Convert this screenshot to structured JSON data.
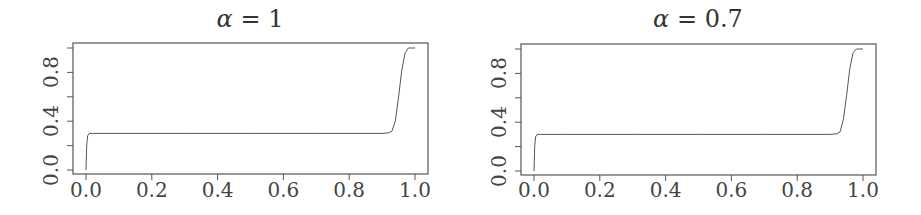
{
  "chart_data": [
    {
      "type": "line",
      "title": "α = 1",
      "title_symbol": "α",
      "title_rest": " = 1",
      "xlabel": "",
      "ylabel": "",
      "xlim": [
        0.0,
        1.0
      ],
      "ylim": [
        0.0,
        1.0
      ],
      "x_ticks": [
        "0.0",
        "0.2",
        "0.4",
        "0.6",
        "0.8",
        "1.0"
      ],
      "y_ticks_labeled": [
        "0.0",
        "0.4",
        "0.8"
      ],
      "y_ticks_all": [
        0.0,
        0.2,
        0.4,
        0.6,
        0.8,
        1.0
      ],
      "grid": false,
      "legend": null,
      "series": [
        {
          "name": "curve",
          "color": "#555555",
          "x": [
            0.0,
            0.002,
            0.005,
            0.01,
            0.02,
            0.1,
            0.3,
            0.5,
            0.7,
            0.9,
            0.92,
            0.93,
            0.94,
            0.95,
            0.96,
            0.97,
            0.98,
            0.99,
            1.0
          ],
          "y": [
            0.0,
            0.2,
            0.28,
            0.3,
            0.3,
            0.3,
            0.3,
            0.3,
            0.3,
            0.3,
            0.305,
            0.32,
            0.4,
            0.6,
            0.82,
            0.96,
            1.0,
            1.0,
            1.0
          ]
        }
      ]
    },
    {
      "type": "line",
      "title": "α = 0.7",
      "title_symbol": "α",
      "title_rest": " = 0.7",
      "xlabel": "",
      "ylabel": "",
      "xlim": [
        0.0,
        1.0
      ],
      "ylim": [
        0.0,
        1.0
      ],
      "x_ticks": [
        "0.0",
        "0.2",
        "0.4",
        "0.6",
        "0.8",
        "1.0"
      ],
      "y_ticks_labeled": [
        "0.0",
        "0.4",
        "0.8"
      ],
      "y_ticks_all": [
        0.0,
        0.2,
        0.4,
        0.6,
        0.8,
        1.0
      ],
      "grid": false,
      "legend": null,
      "series": [
        {
          "name": "curve",
          "color": "#555555",
          "x": [
            0.0,
            0.002,
            0.005,
            0.01,
            0.02,
            0.1,
            0.3,
            0.5,
            0.7,
            0.9,
            0.92,
            0.93,
            0.94,
            0.95,
            0.96,
            0.97,
            0.98,
            0.99,
            1.0
          ],
          "y": [
            0.0,
            0.2,
            0.28,
            0.3,
            0.3,
            0.3,
            0.3,
            0.3,
            0.3,
            0.3,
            0.305,
            0.32,
            0.42,
            0.62,
            0.84,
            0.97,
            1.0,
            1.0,
            1.0
          ]
        }
      ]
    }
  ]
}
